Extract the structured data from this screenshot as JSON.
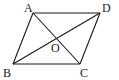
{
  "diagram": {
    "type": "parallelogram-with-diagonals",
    "stroke_color": "#1a1a1a",
    "background": "#ffffff",
    "vertices": {
      "A": {
        "label": "A",
        "x": 33,
        "y": 13
      },
      "D": {
        "label": "D",
        "x": 100,
        "y": 13
      },
      "B": {
        "label": "B",
        "x": 13,
        "y": 64
      },
      "C": {
        "label": "C",
        "x": 80,
        "y": 64
      }
    },
    "intersection": {
      "label": "O",
      "x": 56.5,
      "y": 38.5
    },
    "edges": [
      "AD",
      "DC",
      "CB",
      "BA"
    ],
    "diagonals": [
      "AC",
      "BD"
    ]
  }
}
